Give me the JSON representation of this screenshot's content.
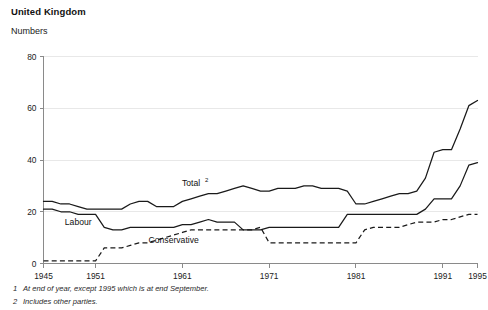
{
  "header": {
    "title": "United Kingdom",
    "units": "Numbers"
  },
  "footnotes": [
    {
      "num": "1",
      "text": "At end of year, except 1995 which is at end September."
    },
    {
      "num": "2",
      "text": "Includes other parties."
    }
  ],
  "chart_data": {
    "type": "line",
    "title": "United Kingdom",
    "subtitle": "Numbers",
    "xlabel": "",
    "ylabel": "Numbers",
    "xlim": [
      1945,
      1995
    ],
    "ylim": [
      0,
      80
    ],
    "yticks": [
      0,
      20,
      40,
      60,
      80
    ],
    "xticks": [
      1945,
      1951,
      1961,
      1971,
      1981,
      1991,
      1995
    ],
    "grid": "horizontal-faint",
    "legend": "inline-labels",
    "x": [
      1945,
      1946,
      1947,
      1948,
      1949,
      1950,
      1951,
      1952,
      1953,
      1954,
      1955,
      1956,
      1957,
      1958,
      1959,
      1960,
      1961,
      1962,
      1963,
      1964,
      1965,
      1966,
      1967,
      1968,
      1969,
      1970,
      1971,
      1972,
      1973,
      1974,
      1975,
      1976,
      1977,
      1978,
      1979,
      1980,
      1981,
      1982,
      1983,
      1984,
      1985,
      1986,
      1987,
      1988,
      1989,
      1990,
      1991,
      1992,
      1993,
      1994,
      1995
    ],
    "series": [
      {
        "name": "Total",
        "label": "Total",
        "superscript": "2",
        "style": "solid",
        "label_x": 1962,
        "label_y": 30,
        "values": [
          24,
          24,
          23,
          23,
          22,
          21,
          21,
          21,
          21,
          21,
          23,
          24,
          24,
          22,
          22,
          22,
          24,
          25,
          26,
          27,
          27,
          28,
          29,
          30,
          29,
          28,
          28,
          29,
          29,
          29,
          30,
          30,
          29,
          29,
          29,
          28,
          23,
          23,
          24,
          25,
          26,
          27,
          27,
          28,
          33,
          43,
          44,
          44,
          52,
          61,
          63
        ]
      },
      {
        "name": "Labour",
        "label": "Labour",
        "style": "solid",
        "label_x": 1949,
        "label_y": 15,
        "values": [
          21,
          21,
          20,
          20,
          19,
          19,
          19,
          14,
          13,
          13,
          14,
          14,
          14,
          14,
          14,
          14,
          15,
          15,
          16,
          17,
          16,
          16,
          16,
          13,
          13,
          13,
          14,
          14,
          14,
          14,
          14,
          14,
          14,
          14,
          14,
          19,
          19,
          19,
          19,
          19,
          19,
          19,
          19,
          19,
          21,
          25,
          25,
          25,
          30,
          38,
          39
        ]
      },
      {
        "name": "Conservative",
        "label": "Conservative",
        "style": "dashed",
        "label_x": 1960,
        "label_y": 8,
        "values": [
          1,
          1,
          1,
          1,
          1,
          1,
          1,
          6,
          6,
          6,
          7,
          8,
          8,
          9,
          10,
          11,
          12,
          13,
          13,
          13,
          13,
          13,
          13,
          13,
          13,
          14,
          8,
          8,
          8,
          8,
          8,
          8,
          8,
          8,
          8,
          8,
          8,
          13,
          14,
          14,
          14,
          14,
          15,
          16,
          16,
          16,
          17,
          17,
          18,
          19,
          19
        ]
      }
    ]
  }
}
